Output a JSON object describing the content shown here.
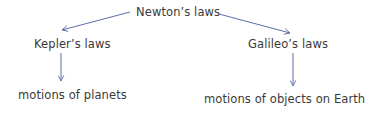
{
  "diagram": {
    "root": {
      "label": "Newton’s laws"
    },
    "branches": [
      {
        "label": "Kepler’s laws",
        "child": "motions of planets"
      },
      {
        "label": "Galileo’s laws",
        "child": "motions of objects on Earth"
      }
    ],
    "colors": {
      "arrow": "#5b6fa8",
      "text": "#3a3a3a",
      "background": "#ffffff"
    }
  }
}
